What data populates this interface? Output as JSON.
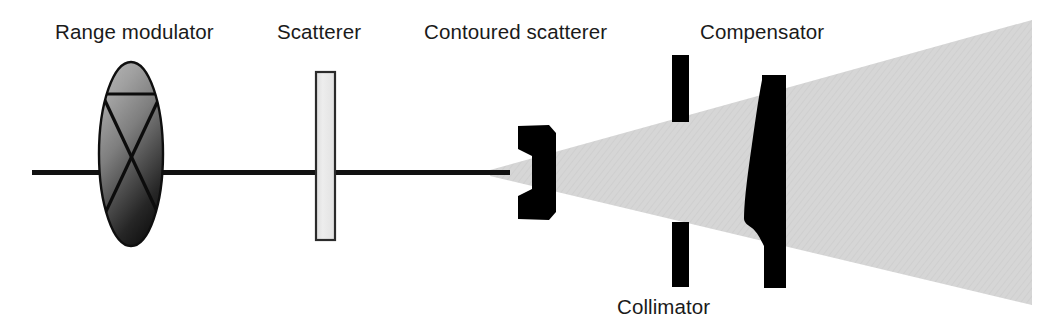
{
  "figure": {
    "width": 1060,
    "height": 335,
    "background_color": "#ffffff"
  },
  "labels": {
    "range_modulator": "Range modulator",
    "scatterer": "Scatterer",
    "contoured_scatterer": "Contoured scatterer",
    "compensator": "Compensator",
    "collimator": "Collimator"
  },
  "colors": {
    "text": "#1a1a1a",
    "beam_axis": "#111111",
    "solid_black": "#000000",
    "cone_fill": "#d4d4d4",
    "scatterer_fill": "#e8e8e8",
    "scatterer_stroke": "#2a2a2a",
    "modulator_light": "#a6a6a6",
    "modulator_dark": "#171717",
    "modulator_stroke": "#111111"
  },
  "components": [
    {
      "name": "beam-axis-line",
      "kind": "line",
      "x1": 32,
      "y1": 172,
      "x2": 508,
      "y2": 172,
      "thickness": 5
    },
    {
      "name": "range-modulator",
      "kind": "ellipse-with-cross",
      "cx": 131,
      "cy": 154,
      "rx": 32,
      "ry": 92
    },
    {
      "name": "scatterer",
      "kind": "rectangle",
      "x": 316,
      "y": 72,
      "width": 19,
      "height": 168
    },
    {
      "name": "contoured-scatterer",
      "kind": "notched-block",
      "x": 518,
      "y": 125,
      "width": 38,
      "height": 95
    },
    {
      "name": "collimator-upper-jaw",
      "kind": "rectangle",
      "x": 672,
      "y": 55,
      "width": 17,
      "height": 67
    },
    {
      "name": "collimator-lower-jaw",
      "kind": "rectangle",
      "x": 672,
      "y": 222,
      "width": 17,
      "height": 65
    },
    {
      "name": "compensator",
      "kind": "tapered-block",
      "x": 744,
      "y": 75,
      "width": 42,
      "height": 213
    },
    {
      "name": "beam-cone",
      "kind": "diverging-fan",
      "apex_x": 490,
      "apex_y": 172,
      "end_x": 1032,
      "top_y": 20,
      "bottom_y": 305
    }
  ]
}
